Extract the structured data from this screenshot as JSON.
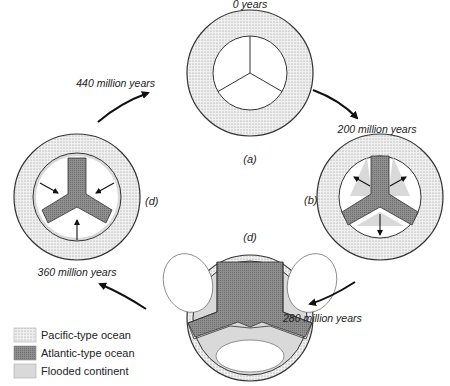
{
  "diagram": {
    "stages": [
      {
        "panel": "(a)",
        "time": "0 years"
      },
      {
        "panel": "(b)",
        "time": "200 million years"
      },
      {
        "panel": "(c)",
        "time": "280 million years"
      },
      {
        "panel": "(d)",
        "time": "360 million years"
      }
    ],
    "cycle_label": "440 million years",
    "legend": [
      {
        "label": "Pacific-type ocean",
        "pattern": "dotted",
        "color": "#e6e6e6"
      },
      {
        "label": "Atlantic-type ocean",
        "pattern": "dark-hatched",
        "color": "#8c8c8c"
      },
      {
        "label": "Flooded continent",
        "pattern": "light-gray",
        "color": "#d6d6d6"
      }
    ]
  },
  "colors": {
    "pacific": "#e8e8e8",
    "atlantic": "#8a8a8a",
    "flooded": "#d9d9d9",
    "continent": "#ffffff",
    "stroke": "#333333"
  }
}
